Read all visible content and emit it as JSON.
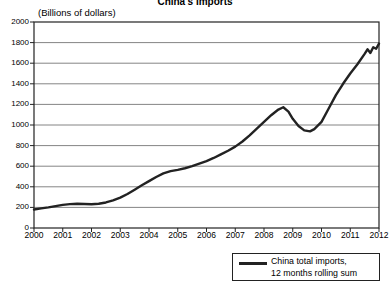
{
  "chart_data": {
    "type": "line",
    "title": "China's Imports",
    "subtitle": "(Billions of dollars)",
    "xlabel": "",
    "ylabel": "",
    "ylim": [
      0,
      2000
    ],
    "xlim": [
      2000,
      2012
    ],
    "yticks": [
      2000,
      1800,
      1600,
      1400,
      1200,
      1000,
      800,
      600,
      400,
      200,
      0
    ],
    "xticks": [
      "2000",
      "2001",
      "2002",
      "2003",
      "2004",
      "2005",
      "2006",
      "2007",
      "2008",
      "2009",
      "2010",
      "2011",
      "2012"
    ],
    "grid": true,
    "legend_position": "bottom-right",
    "series": [
      {
        "name": "China total imports, 12 months rolling sum",
        "color": "#222222",
        "x": [
          2000.0,
          2000.25,
          2000.5,
          2000.75,
          2001.0,
          2001.25,
          2001.5,
          2001.75,
          2002.0,
          2002.25,
          2002.5,
          2002.75,
          2003.0,
          2003.25,
          2003.5,
          2003.75,
          2004.0,
          2004.25,
          2004.5,
          2004.75,
          2005.0,
          2005.25,
          2005.5,
          2005.75,
          2006.0,
          2006.25,
          2006.5,
          2006.75,
          2007.0,
          2007.25,
          2007.5,
          2007.75,
          2008.0,
          2008.25,
          2008.5,
          2008.67,
          2008.85,
          2009.0,
          2009.2,
          2009.4,
          2009.6,
          2009.75,
          2010.0,
          2010.25,
          2010.5,
          2010.75,
          2011.0,
          2011.25,
          2011.5,
          2011.6,
          2011.7,
          2011.8,
          2011.9,
          2012.0
        ],
        "y": [
          180,
          190,
          200,
          212,
          225,
          232,
          235,
          233,
          230,
          235,
          248,
          268,
          295,
          330,
          372,
          415,
          455,
          495,
          530,
          552,
          565,
          580,
          600,
          625,
          650,
          680,
          715,
          750,
          790,
          840,
          900,
          965,
          1030,
          1095,
          1150,
          1172,
          1130,
          1060,
          990,
          948,
          938,
          960,
          1030,
          1160,
          1290,
          1400,
          1500,
          1590,
          1690,
          1735,
          1700,
          1755,
          1740,
          1790
        ]
      }
    ]
  },
  "legend": {
    "label_line1": "China total imports,",
    "label_line2": "12 months rolling sum"
  }
}
